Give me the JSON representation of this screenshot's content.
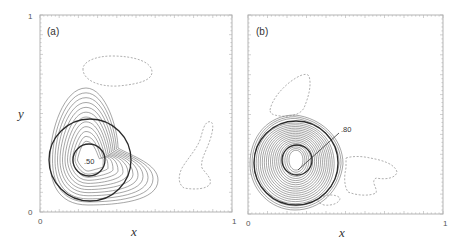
{
  "figure": {
    "panels": [
      {
        "id": "a",
        "label": "(a)",
        "x_axis": {
          "label": "x",
          "ticks": [
            "0",
            "1"
          ]
        },
        "y_axis": {
          "label": "y",
          "ticks": [
            "0",
            "1"
          ]
        },
        "annotation": ".50"
      },
      {
        "id": "b",
        "label": "(b)",
        "x_axis": {
          "label": "x",
          "ticks": [
            "0",
            "1"
          ]
        },
        "y_axis": {
          "label": "",
          "ticks": []
        },
        "annotation": ".80"
      }
    ]
  },
  "chart_data": [
    {
      "type": "contour",
      "title": "(a)",
      "xlabel": "x",
      "ylabel": "y",
      "xlim": [
        0,
        1
      ],
      "ylim": [
        0,
        1
      ],
      "grid": false,
      "solid_contours": {
        "count": 12,
        "peak_location": [
          0.25,
          0.32
        ],
        "description": "positive contours, teardrop shaped, extending right toward x~0.65"
      },
      "dashed_contours": [
        {
          "center": [
            0.42,
            0.75
          ],
          "description": "negative contour, elongated oval"
        },
        {
          "center": [
            0.8,
            0.28
          ],
          "description": "negative contour, boot/foot shape"
        }
      ],
      "circles": [
        {
          "center": [
            0.26,
            0.3
          ],
          "radius": 0.24
        },
        {
          "center": [
            0.25,
            0.3
          ],
          "radius": 0.09
        }
      ],
      "annotations": [
        {
          "text": ".50",
          "at": [
            0.25,
            0.3
          ]
        }
      ]
    },
    {
      "type": "contour",
      "title": "(b)",
      "xlabel": "x",
      "ylabel": "",
      "xlim": [
        0,
        1
      ],
      "ylim": [
        0,
        1
      ],
      "grid": false,
      "solid_contours": {
        "count": 20,
        "peak_location": [
          0.26,
          0.24
        ],
        "description": "dense positive contours, concentric around a circle"
      },
      "dashed_contours": [
        {
          "center": [
            0.28,
            0.62
          ],
          "description": "negative contour above main peak"
        },
        {
          "center": [
            0.6,
            0.23
          ],
          "description": "negative contour right of main peak"
        },
        {
          "center": [
            0.44,
            0.05
          ],
          "description": "small negative contour below"
        }
      ],
      "circles": [
        {
          "center": [
            0.26,
            0.26
          ],
          "radius": 0.24
        },
        {
          "center": [
            0.25,
            0.26
          ],
          "radius": 0.09
        }
      ],
      "annotations": [
        {
          "text": ".80",
          "at": [
            0.5,
            0.47
          ],
          "leader_to": [
            0.26,
            0.22
          ]
        }
      ]
    }
  ]
}
